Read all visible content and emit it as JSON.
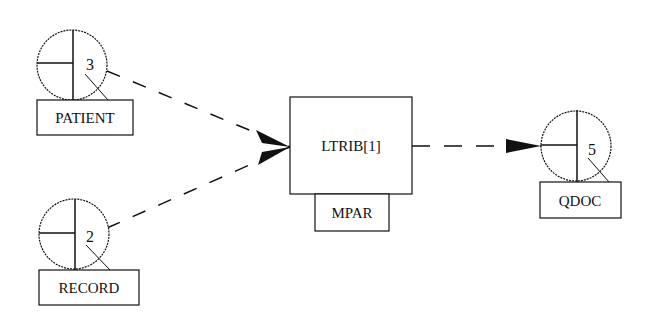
{
  "diagram": {
    "background": "#ffffff",
    "stroke_color": "#111111",
    "datastores": [
      {
        "id": "patient",
        "label": "PATIENT",
        "number": "3",
        "cx": 72,
        "cy": 65,
        "r": 35,
        "box": {
          "x": 37,
          "y": 100,
          "w": 96,
          "h": 35
        }
      },
      {
        "id": "record",
        "label": "RECORD",
        "number": "2",
        "cx": 74,
        "cy": 234,
        "r": 35,
        "box": {
          "x": 39,
          "y": 270,
          "w": 100,
          "h": 35
        }
      },
      {
        "id": "qdoc",
        "label": "QDOC",
        "number": "5",
        "cx": 576,
        "cy": 146,
        "r": 35,
        "box": {
          "x": 540,
          "y": 182,
          "w": 81,
          "h": 36
        }
      }
    ],
    "process": {
      "id": "ltrib",
      "label": "LTRIB[1]",
      "box": {
        "x": 290,
        "y": 97,
        "w": 122,
        "h": 97
      },
      "sublabel": "MPAR",
      "subbox": {
        "x": 315,
        "y": 194,
        "w": 74,
        "h": 37
      }
    },
    "flows": [
      {
        "from": "patient",
        "to": "ltrib",
        "style": "dashed"
      },
      {
        "from": "record",
        "to": "ltrib",
        "style": "dashed"
      },
      {
        "from": "ltrib",
        "to": "qdoc",
        "style": "dashed"
      }
    ]
  }
}
